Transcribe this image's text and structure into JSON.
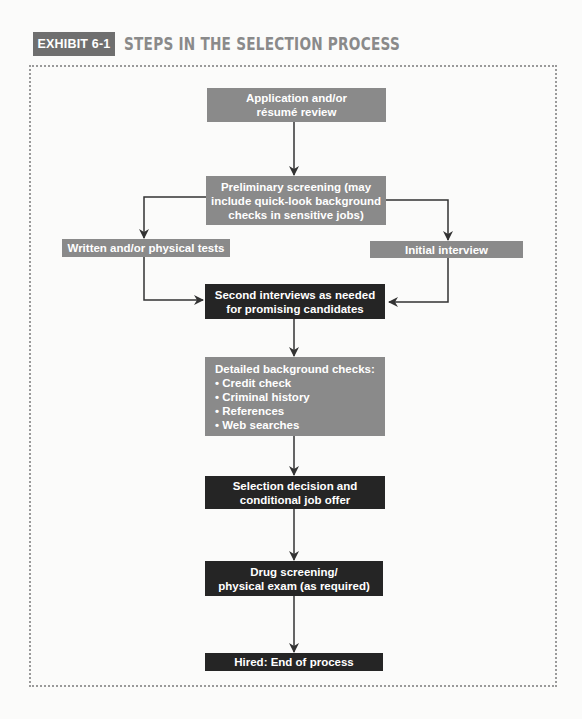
{
  "header": {
    "exhibit_label": "EXHIBIT 6-1",
    "title": "STEPS IN THE SELECTION PROCESS"
  },
  "flow": {
    "application": {
      "line1": "Application and/or",
      "line2": "résumé review"
    },
    "preliminary": {
      "line1": "Preliminary screening (may",
      "line2": "include quick-look background",
      "line3": "checks in sensitive jobs)"
    },
    "written_tests": {
      "label": "Written and/or physical tests"
    },
    "initial_interview": {
      "label": "Initial interview"
    },
    "second_interviews": {
      "line1": "Second interviews as needed",
      "line2": "for promising candidates"
    },
    "background_checks": {
      "heading": "Detailed background checks:",
      "items": [
        "• Credit check",
        "• Criminal history",
        "• References",
        "• Web searches"
      ]
    },
    "selection": {
      "line1": "Selection decision and",
      "line2": "conditional job offer"
    },
    "drug_screening": {
      "line1": "Drug screening/",
      "line2": "physical exam (as required)"
    },
    "hired": {
      "label": "Hired: End of process"
    }
  },
  "colors": {
    "gray_box": "#8a8a8a",
    "dark_box": "#252525",
    "arrow": "#333333"
  }
}
